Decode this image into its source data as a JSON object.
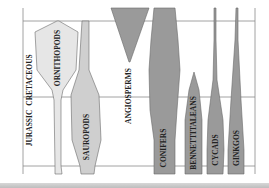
{
  "diagram": {
    "type": "spindle-diagram",
    "periods": [
      {
        "name": "CRETACEOUS",
        "label_x": 30,
        "label_y": 60
      },
      {
        "name": "JURASSIC",
        "label_x": 30,
        "label_y": 135
      }
    ],
    "groups": [
      {
        "name": "ORNITHOPODS",
        "fill": "#e6e6e6"
      },
      {
        "name": "SAUROPODS",
        "fill": "#cfcfcf"
      },
      {
        "name": "ANGIOSPERMS",
        "fill": "#9a9a9a"
      },
      {
        "name": "CONIFERS",
        "fill": "#9a9a9a"
      },
      {
        "name": "BENNETTITALEANS",
        "fill": "#9a9a9a"
      },
      {
        "name": "CYCADS",
        "fill": "#9a9a9a"
      },
      {
        "name": "GINKGOS",
        "fill": "#9a9a9a"
      }
    ],
    "colors": {
      "grid": "#8a8a8a",
      "outline": "#6a6a6a",
      "text": "#222222",
      "background": "#ffffff"
    }
  }
}
